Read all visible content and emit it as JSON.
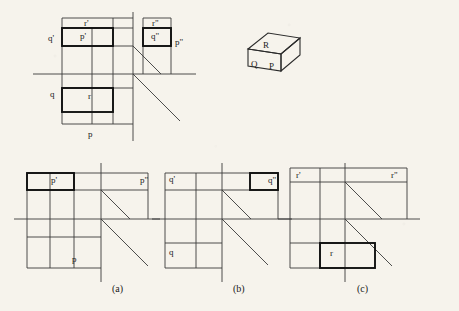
{
  "figure": {
    "title": "",
    "background_color": "#f6f3ec",
    "line_color": "#3a3a3a",
    "bold_color": "#111111"
  },
  "top_diagram": {
    "labels": [
      {
        "id": "q-prime",
        "text": "q'",
        "x": 48,
        "y": 34
      },
      {
        "id": "p-prime-rect",
        "text": "p'",
        "x": 80,
        "y": 35
      },
      {
        "id": "r-prime",
        "text": "r'",
        "x": 84,
        "y": 21
      },
      {
        "id": "r-double-prime",
        "text": "r\"",
        "x": 152,
        "y": 21
      },
      {
        "id": "q-double-prime",
        "text": "q\"",
        "x": 153,
        "y": 35
      },
      {
        "id": "p-double-prime",
        "text": "p\"",
        "x": 176,
        "y": 38
      },
      {
        "id": "q-lower",
        "text": "q",
        "x": 50,
        "y": 90
      },
      {
        "id": "r-lower",
        "text": "r",
        "x": 88,
        "y": 92
      },
      {
        "id": "p-bottom",
        "text": "p",
        "x": 88,
        "y": 133
      }
    ]
  },
  "solid": {
    "labels": [
      {
        "id": "solid-R",
        "text": "R",
        "x": 264,
        "y": 45
      },
      {
        "id": "solid-Q",
        "text": "Q",
        "x": 246,
        "y": 66
      },
      {
        "id": "solid-P",
        "text": "P",
        "x": 266,
        "y": 69
      }
    ]
  },
  "panels": [
    {
      "id": "panel-a",
      "caption": "(a)",
      "caption_x": 112,
      "caption_y": 290,
      "labels": [
        {
          "id": "a-p-prime",
          "text": "p'",
          "x": 51,
          "y": 180
        },
        {
          "id": "a-p-double-prime",
          "text": "p\"",
          "x": 142,
          "y": 180
        },
        {
          "id": "a-p-bottom",
          "text": "p",
          "x": 72,
          "y": 259
        }
      ]
    },
    {
      "id": "panel-b",
      "caption": "(b)",
      "caption_x": 233,
      "caption_y": 290,
      "labels": [
        {
          "id": "b-q-prime",
          "text": "q'",
          "x": 172,
          "y": 178
        },
        {
          "id": "b-q-double-prime",
          "text": "q\"",
          "x": 272,
          "y": 180
        },
        {
          "id": "b-q-lower",
          "text": "q",
          "x": 172,
          "y": 252
        }
      ]
    },
    {
      "id": "panel-c",
      "caption": "(c)",
      "caption_x": 357,
      "caption_y": 290,
      "labels": [
        {
          "id": "c-r-prime",
          "text": "r'",
          "x": 297,
          "y": 175
        },
        {
          "id": "c-r-double-prime",
          "text": "r\"",
          "x": 393,
          "y": 175
        },
        {
          "id": "c-r-lower",
          "text": "r",
          "x": 331,
          "y": 252
        }
      ]
    }
  ]
}
